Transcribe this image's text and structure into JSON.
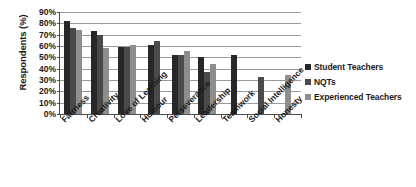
{
  "chart_data": {
    "type": "bar",
    "title": "",
    "xlabel": "",
    "ylabel": "Respondents (%)",
    "ylim": [
      0,
      90
    ],
    "ytick_labels": [
      "90%",
      "80%",
      "70%",
      "60%",
      "50%",
      "40%",
      "30%",
      "20%",
      "10%",
      "0%"
    ],
    "ytick_values": [
      90,
      80,
      70,
      60,
      50,
      40,
      30,
      20,
      10,
      0
    ],
    "grid": true,
    "legend_position": "right",
    "categories": [
      "Fairness",
      "Creativity",
      "Love of Learning",
      "Humour",
      "Perseverance",
      "Leadership",
      "Teamwork",
      "Social Intelligence",
      "Honesty"
    ],
    "series": [
      {
        "name": "Student Teachers",
        "color": "#272727",
        "values": [
          82,
          73,
          59,
          61,
          52,
          50,
          52,
          null,
          null
        ]
      },
      {
        "name": "NQTs",
        "color": "#4a4a4a",
        "values": [
          76,
          70,
          59,
          64,
          52,
          37,
          null,
          33,
          null
        ]
      },
      {
        "name": "Experienced Teachers",
        "color": "#8e8e8e",
        "values": [
          74,
          58,
          61,
          null,
          56,
          44,
          null,
          null,
          34
        ]
      }
    ]
  },
  "legend": {
    "items": [
      {
        "label": "Student Teachers"
      },
      {
        "label": "NQTs"
      },
      {
        "label": "Experienced Teachers"
      }
    ]
  },
  "axis": {
    "y_title": "Respondents (%)"
  }
}
